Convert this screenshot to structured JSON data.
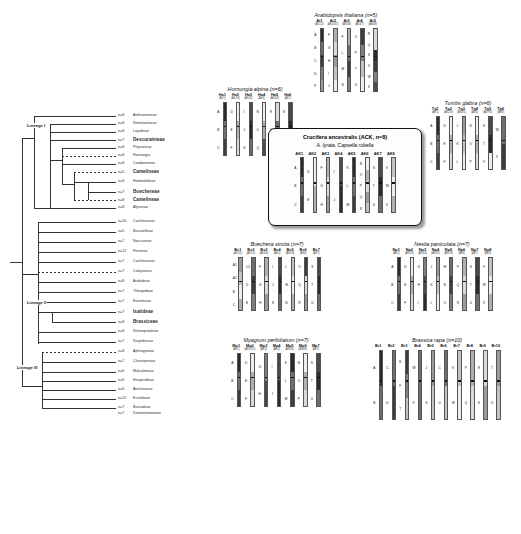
{
  "tree": {
    "lineages": [
      {
        "label": "Lineage I"
      },
      {
        "label": "Lineage II"
      },
      {
        "label": "Lineage III"
      }
    ],
    "tips": [
      {
        "n": "n=8",
        "name": "Aethionemeae",
        "bold": false,
        "dashed": false
      },
      {
        "n": "n=8",
        "name": "Smelowskieae",
        "bold": false,
        "dashed": false
      },
      {
        "n": "n=8",
        "name": "Lepidieae",
        "bold": false,
        "dashed": false
      },
      {
        "n": "n=7",
        "name": "Descurainieae",
        "bold": true,
        "dashed": false
      },
      {
        "n": "n=8",
        "name": "Physarieae",
        "bold": false,
        "dashed": false
      },
      {
        "n": "n=8",
        "name": "Hornungia",
        "bold": false,
        "dashed": true
      },
      {
        "n": "n=8",
        "name": "Cardamineae",
        "bold": false,
        "dashed": false
      },
      {
        "n": "n=5",
        "name": "Camelineae",
        "bold": true,
        "dashed": true
      },
      {
        "n": "n=8",
        "name": "Halimolobeae",
        "bold": false,
        "dashed": false
      },
      {
        "n": "n=7",
        "name": "Boechereae",
        "bold": true,
        "dashed": false
      },
      {
        "n": "n=8",
        "name": "Camelineae",
        "bold": true,
        "dashed": true
      },
      {
        "n": "n=8",
        "name": "Alysseae",
        "bold": false,
        "dashed": false
      },
      {
        "n": "n=10",
        "name": "Cochlearieae",
        "bold": false,
        "dashed": false
      },
      {
        "n": "n=5",
        "name": "Biscutelleae",
        "bold": false,
        "dashed": false
      },
      {
        "n": "n=7",
        "name": "Noccaeeae",
        "bold": false,
        "dashed": false
      },
      {
        "n": "n=12",
        "name": "Forsteae",
        "bold": false,
        "dashed": false
      },
      {
        "n": "n=7",
        "name": "Cochlearieae",
        "bold": false,
        "dashed": false
      },
      {
        "n": "n=7",
        "name": "Calepineae",
        "bold": false,
        "dashed": true
      },
      {
        "n": "n=8",
        "name": "Arabideae",
        "bold": false,
        "dashed": false
      },
      {
        "n": "n=7",
        "name": "Thlaspideae",
        "bold": false,
        "dashed": false
      },
      {
        "n": "n=7",
        "name": "Eutremeae",
        "bold": false,
        "dashed": false
      },
      {
        "n": "n=7",
        "name": "Isatideae",
        "bold": true,
        "dashed": false
      },
      {
        "n": "n=8",
        "name": "Brassiceae",
        "bold": true,
        "dashed": false
      },
      {
        "n": "n=8",
        "name": "Schizopetaleae",
        "bold": false,
        "dashed": false
      },
      {
        "n": "n=7",
        "name": "Sisymbrieae",
        "bold": false,
        "dashed": false
      },
      {
        "n": "n=8",
        "name": "Aphragmeae",
        "bold": false,
        "dashed": false
      },
      {
        "n": "n=7",
        "name": "Chorisporeae",
        "bold": false,
        "dashed": false
      },
      {
        "n": "n=6",
        "name": "Malcolmieae",
        "bold": false,
        "dashed": false
      },
      {
        "n": "n=6",
        "name": "Hesperideae",
        "bold": false,
        "dashed": false
      },
      {
        "n": "n=6",
        "name": "Anchonieae",
        "bold": false,
        "dashed": false
      },
      {
        "n": "n=15",
        "name": "Euclidieae",
        "bold": false,
        "dashed": false
      },
      {
        "n": "n=7",
        "name": "Buniadeae",
        "bold": false,
        "dashed": false
      },
      {
        "n": "n=7",
        "name": "Dontostemoneae",
        "bold": false,
        "dashed": false
      }
    ]
  },
  "ack": {
    "title": "Crucifera ancestralis (ACK, n=8)",
    "subtitle": "A. lyrata, Capsella rubella",
    "chromosomes": [
      {
        "label": "AK1",
        "blocks": [
          "A",
          "B",
          "C"
        ]
      },
      {
        "label": "AK2",
        "blocks": [
          "D",
          "E"
        ]
      },
      {
        "label": "AK3",
        "blocks": [
          "F",
          "G",
          "H"
        ]
      },
      {
        "label": "AK4",
        "blocks": [
          "I",
          "J"
        ]
      },
      {
        "label": "AK5",
        "blocks": [
          "K",
          "L",
          "M"
        ]
      },
      {
        "label": "AK6",
        "blocks": [
          "N",
          "O",
          "P",
          "Q",
          "R"
        ]
      },
      {
        "label": "AK7",
        "blocks": [
          "S",
          "T",
          "U"
        ]
      },
      {
        "label": "AK8",
        "blocks": [
          "V",
          "W",
          "X"
        ]
      }
    ]
  },
  "panels": [
    {
      "id": "arabidopsis",
      "title": "Arabidopsis thaliana (n=5)",
      "chromosomes": [
        {
          "label": "At1",
          "sub": "(AK1/2)",
          "blocks": [
            "A",
            "B",
            "C",
            "D",
            "F"
          ]
        },
        {
          "label": "At2",
          "sub": "(AK3/4/5)",
          "blocks": [
            "F",
            "G",
            "H",
            "I",
            "J"
          ]
        },
        {
          "label": "At3",
          "sub": "(AK3/6)",
          "blocks": [
            "F",
            "L",
            "M",
            "N"
          ]
        },
        {
          "label": "At4",
          "sub": "(AK4/7)",
          "blocks": [
            "O",
            "P",
            "T",
            "U"
          ]
        },
        {
          "label": "At5",
          "sub": "(AK6/8)",
          "blocks": [
            "R",
            "Q",
            "S",
            "V",
            "W",
            "X"
          ]
        }
      ]
    },
    {
      "id": "hornungia",
      "title": "Hornungia alpina (n=6)",
      "chromosomes": [
        {
          "label": "Ha1",
          "sub": "(AK1)",
          "blocks": [
            "A",
            "B",
            "C"
          ]
        },
        {
          "label": "Ha2",
          "sub": "(AK2/3)",
          "blocks": [
            "D",
            "E",
            "F"
          ]
        },
        {
          "label": "Ha3",
          "sub": "(AK4/5)",
          "blocks": [
            "I",
            "J",
            "K"
          ]
        },
        {
          "label": "Ha4",
          "sub": "(AK6)",
          "blocks": [
            "N",
            "O",
            "Q"
          ]
        },
        {
          "label": "Ha5",
          "sub": "(AK6/8)",
          "blocks": [
            "R",
            "V",
            "W"
          ]
        },
        {
          "label": "Ha6",
          "sub": "(AK7)",
          "blocks": [
            "S",
            "T",
            "X"
          ]
        }
      ]
    },
    {
      "id": "turritis",
      "title": "Turritis glabra (n=6)",
      "chromosomes": [
        {
          "label": "Tg1",
          "sub": "(AK1)",
          "blocks": [
            "A",
            "B",
            "C"
          ]
        },
        {
          "label": "Tg2",
          "sub": "(AK2/3)",
          "blocks": [
            "D",
            "E",
            "F"
          ]
        },
        {
          "label": "Tg3",
          "sub": "(AK4/5)",
          "blocks": [
            "J",
            "K",
            "L"
          ]
        },
        {
          "label": "Tg4",
          "sub": "(AK6)",
          "blocks": [
            "N",
            "O",
            "P"
          ]
        },
        {
          "label": "Tg5",
          "sub": "(AK7/8)",
          "blocks": [
            "S",
            "T",
            "V"
          ]
        },
        {
          "label": "Tg6",
          "sub": "(AK8)",
          "blocks": [
            "W",
            "X"
          ]
        }
      ]
    },
    {
      "id": "boechera",
      "title": "Boechera stricta (n=7)",
      "chromosomes": [
        {
          "label": "Bs1",
          "sub": "(AK1/5)",
          "blocks": [
            "A1",
            "A2",
            "B",
            "C"
          ]
        },
        {
          "label": "Bs2",
          "sub": "(AK1/2)",
          "blocks": [
            "C2",
            "D",
            "E"
          ]
        },
        {
          "label": "Bs3",
          "sub": "(AK3/6)",
          "blocks": [
            "F",
            "G",
            "H"
          ]
        },
        {
          "label": "Bs4",
          "sub": "(AK4)",
          "blocks": [
            "I",
            "J",
            "K"
          ]
        },
        {
          "label": "Bs5",
          "sub": "(AK5/6)",
          "blocks": [
            "L",
            "M",
            "N"
          ]
        },
        {
          "label": "Bs6",
          "sub": "(AK6)",
          "blocks": [
            "O",
            "Q",
            "R"
          ]
        },
        {
          "label": "Bs7",
          "sub": "(AK7)",
          "blocks": [
            "S",
            "T",
            "U"
          ]
        }
      ]
    },
    {
      "id": "neslia",
      "title": "Neslia paniculata (n=7)",
      "chromosomes": [
        {
          "label": "Np1",
          "sub": "(AK1)",
          "blocks": [
            "A",
            "B",
            "C"
          ]
        },
        {
          "label": "Np2",
          "sub": "(AK2/3)",
          "blocks": [
            "D",
            "E",
            "F"
          ]
        },
        {
          "label": "Np3",
          "sub": "(AK3/4)",
          "blocks": [
            "G",
            "H",
            "I"
          ]
        },
        {
          "label": "Np4",
          "sub": "(AK4/5)",
          "blocks": [
            "J",
            "K",
            "L"
          ]
        },
        {
          "label": "Np5",
          "sub": "(AK5/6)",
          "blocks": [
            "M",
            "N",
            "O"
          ]
        },
        {
          "label": "Np6",
          "sub": "(AK6)",
          "blocks": [
            "P",
            "Q",
            "R"
          ]
        },
        {
          "label": "Np7",
          "sub": "(AK7)",
          "blocks": [
            "S",
            "T",
            "U"
          ]
        },
        {
          "label": "Np8",
          "sub": "(AK8)",
          "blocks": [
            "V",
            "W",
            "X"
          ]
        }
      ]
    },
    {
      "id": "myagrum",
      "title": "Myagrum perfoliatum (n=7)",
      "chromosomes": [
        {
          "label": "Mp1",
          "sub": "(AK1)",
          "blocks": [
            "A",
            "B",
            "C"
          ]
        },
        {
          "label": "Mp2",
          "sub": "(AK2/3/5)",
          "blocks": [
            "D",
            "E",
            "F"
          ]
        },
        {
          "label": "Mp3",
          "sub": "(AK3)",
          "blocks": [
            "G",
            "H"
          ]
        },
        {
          "label": "Mp4",
          "sub": "(AK4)",
          "blocks": [
            "I",
            "J"
          ]
        },
        {
          "label": "Mp5",
          "sub": "(AK5/6)",
          "blocks": [
            "K",
            "L",
            "M"
          ]
        },
        {
          "label": "Mp6",
          "sub": "(AK6/8)",
          "blocks": [
            "N",
            "O",
            "P"
          ]
        },
        {
          "label": "Mp7",
          "sub": "(AK7)",
          "blocks": [
            "S",
            "T",
            "U"
          ]
        }
      ]
    },
    {
      "id": "brassica",
      "title": "Brassica rapa (n=10)",
      "chromosomes": [
        {
          "label": "Br1",
          "sub": "",
          "blocks": [
            "A",
            "B"
          ]
        },
        {
          "label": "Br2",
          "sub": "",
          "blocks": [
            "C",
            "D"
          ]
        },
        {
          "label": "Br3",
          "sub": "",
          "blocks": [
            "E",
            "F",
            "T"
          ]
        },
        {
          "label": "Br4",
          "sub": "",
          "blocks": [
            "W",
            "V"
          ]
        },
        {
          "label": "Br5",
          "sub": "",
          "blocks": [
            "J",
            "K"
          ]
        },
        {
          "label": "Br6",
          "sub": "",
          "blocks": [
            "C",
            "U"
          ]
        },
        {
          "label": "Br7",
          "sub": "",
          "blocks": [
            "V",
            "W"
          ]
        },
        {
          "label": "Br8",
          "sub": "",
          "blocks": [
            "P",
            "Q"
          ]
        },
        {
          "label": "Br9",
          "sub": "",
          "blocks": [
            "R",
            "S"
          ]
        },
        {
          "label": "Br10",
          "sub": "",
          "blocks": [
            "T",
            "U"
          ]
        }
      ]
    }
  ]
}
